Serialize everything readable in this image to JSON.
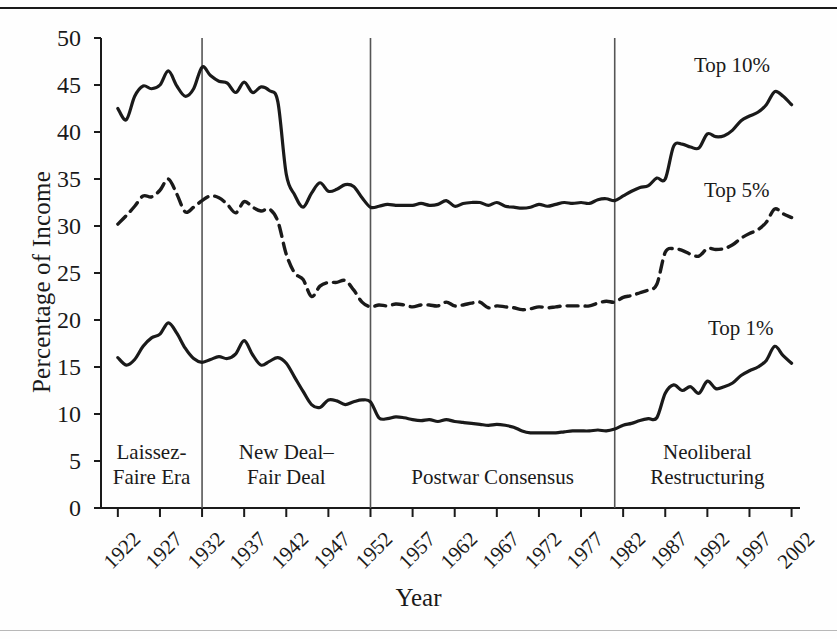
{
  "chart_data": {
    "type": "line",
    "title": "",
    "xlabel": "Year",
    "ylabel": "Percentage of Income",
    "xlim": [
      1920,
      2003
    ],
    "ylim": [
      0,
      50
    ],
    "ytick_values": [
      0,
      5,
      10,
      15,
      20,
      25,
      30,
      35,
      40,
      45,
      50
    ],
    "ytick_labels": [
      "0",
      "5",
      "10",
      "15",
      "20",
      "25",
      "30",
      "35",
      "40",
      "45",
      "50"
    ],
    "xtick_values": [
      1922,
      1927,
      1932,
      1937,
      1942,
      1947,
      1952,
      1957,
      1962,
      1967,
      1972,
      1977,
      1982,
      1987,
      1992,
      1997,
      2002
    ],
    "xtick_labels": [
      "1922",
      "1927",
      "1932",
      "1937",
      "1942",
      "1947",
      "1952",
      "1957",
      "1962",
      "1967",
      "1972",
      "1977",
      "1982",
      "1987",
      "1992",
      "1997",
      "2002"
    ],
    "grid": false,
    "legend_position": "inline-right",
    "x": [
      1922,
      1923,
      1924,
      1925,
      1926,
      1927,
      1928,
      1929,
      1930,
      1931,
      1932,
      1933,
      1934,
      1935,
      1936,
      1937,
      1938,
      1939,
      1940,
      1941,
      1942,
      1943,
      1944,
      1945,
      1946,
      1947,
      1948,
      1949,
      1950,
      1951,
      1952,
      1953,
      1954,
      1955,
      1956,
      1957,
      1958,
      1959,
      1960,
      1961,
      1962,
      1963,
      1964,
      1965,
      1966,
      1967,
      1968,
      1969,
      1970,
      1971,
      1972,
      1973,
      1974,
      1975,
      1976,
      1977,
      1978,
      1979,
      1980,
      1981,
      1982,
      1983,
      1984,
      1985,
      1986,
      1987,
      1988,
      1989,
      1990,
      1991,
      1992,
      1993,
      1994,
      1995,
      1996,
      1997,
      1998,
      1999,
      2000,
      2001,
      2002
    ],
    "series": [
      {
        "name": "Top 10%",
        "style": "solid",
        "label": "Top 10%",
        "values": [
          42.5,
          41.3,
          43.8,
          44.9,
          44.6,
          45.0,
          46.5,
          44.9,
          43.8,
          44.6,
          46.9,
          46.0,
          45.4,
          45.2,
          44.2,
          45.3,
          44.2,
          44.8,
          44.4,
          43.2,
          35.5,
          33.3,
          32.0,
          33.5,
          34.6,
          33.7,
          33.9,
          34.4,
          34.2,
          33.0,
          32.0,
          32.1,
          32.3,
          32.2,
          32.2,
          32.2,
          32.4,
          32.2,
          32.3,
          32.7,
          32.1,
          32.4,
          32.5,
          32.5,
          32.2,
          32.5,
          32.1,
          32.0,
          31.9,
          32.0,
          32.3,
          32.1,
          32.3,
          32.5,
          32.4,
          32.5,
          32.4,
          32.8,
          32.9,
          32.7,
          33.2,
          33.7,
          34.1,
          34.3,
          35.1,
          35.0,
          38.5,
          38.7,
          38.4,
          38.3,
          39.8,
          39.5,
          39.6,
          40.2,
          41.2,
          41.7,
          42.1,
          42.9,
          44.3,
          43.8,
          42.9
        ]
      },
      {
        "name": "Top 5%",
        "style": "dashed",
        "label": "Top 5%",
        "values": [
          30.2,
          31.1,
          32.1,
          33.2,
          33.1,
          33.8,
          35.0,
          33.4,
          31.5,
          32.0,
          32.7,
          33.2,
          33.0,
          32.3,
          31.4,
          32.6,
          32.0,
          31.6,
          31.8,
          30.5,
          27.0,
          25.0,
          24.3,
          22.5,
          23.6,
          24.0,
          24.0,
          24.2,
          23.2,
          21.9,
          21.4,
          21.6,
          21.5,
          21.7,
          21.6,
          21.4,
          21.6,
          21.6,
          21.5,
          21.9,
          21.5,
          21.6,
          21.8,
          21.9,
          21.3,
          21.5,
          21.4,
          21.3,
          21.1,
          21.2,
          21.4,
          21.3,
          21.4,
          21.5,
          21.5,
          21.5,
          21.5,
          21.8,
          22.0,
          21.9,
          22.4,
          22.6,
          22.9,
          23.2,
          23.8,
          27.2,
          27.6,
          27.4,
          27.0,
          26.8,
          27.6,
          27.5,
          27.6,
          28.0,
          28.7,
          29.2,
          29.6,
          30.4,
          31.8,
          31.3,
          30.9
        ]
      },
      {
        "name": "Top 1%",
        "style": "solid",
        "label": "Top 1%",
        "values": [
          16.0,
          15.2,
          15.8,
          17.2,
          18.1,
          18.5,
          19.7,
          18.6,
          17.0,
          15.9,
          15.5,
          15.8,
          16.1,
          15.9,
          16.4,
          17.8,
          16.3,
          15.2,
          15.6,
          16.0,
          15.4,
          13.9,
          12.4,
          11.0,
          10.7,
          11.5,
          11.4,
          11.0,
          11.3,
          11.5,
          11.3,
          9.6,
          9.5,
          9.7,
          9.6,
          9.4,
          9.3,
          9.4,
          9.2,
          9.4,
          9.2,
          9.1,
          9.0,
          8.9,
          8.8,
          8.9,
          8.8,
          8.6,
          8.2,
          8.0,
          8.0,
          8.0,
          8.0,
          8.1,
          8.2,
          8.2,
          8.2,
          8.3,
          8.2,
          8.4,
          8.8,
          9.0,
          9.3,
          9.5,
          9.6,
          12.2,
          13.1,
          12.5,
          12.9,
          12.2,
          13.5,
          12.7,
          12.9,
          13.3,
          14.1,
          14.6,
          15.0,
          15.7,
          17.2,
          16.2,
          15.4
        ]
      }
    ],
    "era_bands": [
      {
        "id": "laissez-faire",
        "line1": "Laissez-",
        "line2": "Faire Era",
        "start": 1920,
        "end": 1932
      },
      {
        "id": "new-deal",
        "line1": "New Deal–",
        "line2": "Fair Deal",
        "start": 1932,
        "end": 1952
      },
      {
        "id": "postwar",
        "line1": "Postwar Consensus",
        "line2": "",
        "start": 1952,
        "end": 1981
      },
      {
        "id": "neoliberal",
        "line1": "Neoliberal",
        "line2": "Restructuring",
        "start": 1981,
        "end": 2003
      }
    ],
    "divider_years": [
      1932,
      1952,
      1981
    ],
    "colors": {
      "line": "#1a1a1a",
      "axis": "#1a1a1a",
      "divider": "#555555",
      "background": "#fefefe"
    }
  }
}
